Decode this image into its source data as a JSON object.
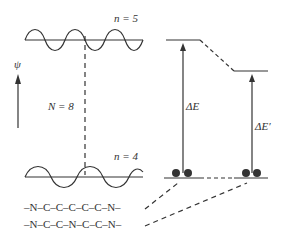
{
  "labels": {
    "n_top": "n = 5",
    "n_bottom": "n = 4",
    "psi": "ψ",
    "N": "N = 8",
    "dE": "ΔE",
    "dE_prime": "ΔE′",
    "chain1": "–N–C–C–C–C–C–N–",
    "chain2": "–N–C–C–N–C–C–N–"
  },
  "colors": {
    "line": "#333333"
  }
}
